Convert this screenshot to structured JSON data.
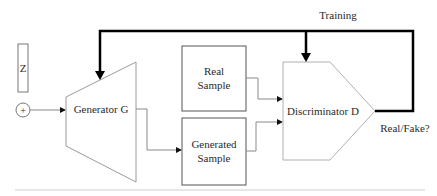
{
  "diagram": {
    "title_label": "Training",
    "output_label": "Real/Fake?",
    "input": {
      "noise_label": "Z",
      "combine_symbol": "+"
    },
    "nodes": {
      "generator": {
        "label": "Generator G"
      },
      "real_sample": {
        "line1": "Real",
        "line2": "Sample"
      },
      "generated_sample": {
        "line1": "Generated",
        "line2": "Sample"
      },
      "discriminator": {
        "label": "Discriminator D"
      }
    },
    "edges": [
      {
        "from": "combine",
        "to": "generator"
      },
      {
        "from": "generator",
        "to": "generated_sample"
      },
      {
        "from": "real_sample",
        "to": "discriminator"
      },
      {
        "from": "generated_sample",
        "to": "discriminator"
      },
      {
        "from": "discriminator",
        "to": "generator",
        "label": "Training",
        "style": "thick"
      },
      {
        "from": "discriminator",
        "to": "discriminator",
        "label": "Training",
        "style": "thick"
      }
    ],
    "colors": {
      "thin_line": "#8a8a8a",
      "box_border": "#555555",
      "thick_line": "#000000",
      "text": "#2a2a2a",
      "baseline": "#cfcfcf"
    }
  }
}
